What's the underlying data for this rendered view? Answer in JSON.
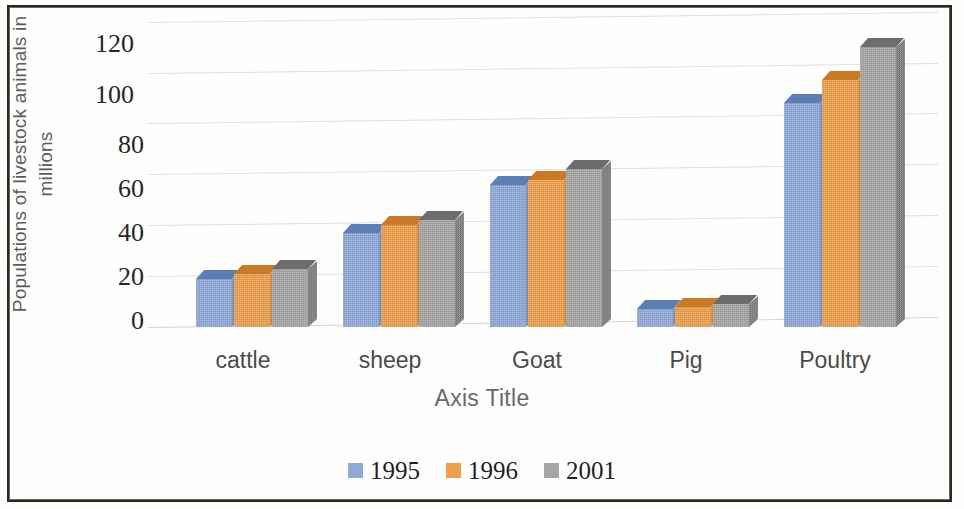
{
  "axes": {
    "y_title": "Populations of livestock animals in\nmillions",
    "x_title": "Axis Title",
    "y_ticks": [
      "0",
      "20",
      "40",
      "60",
      "80",
      "100",
      "120"
    ]
  },
  "legend": {
    "items": [
      {
        "label": "1995",
        "color": "#8faada"
      },
      {
        "label": "1996",
        "color": "#f0a04b"
      },
      {
        "label": "2001",
        "color": "#a6a6a6"
      }
    ]
  },
  "chart_data": {
    "type": "bar",
    "title": "",
    "subtitle": "",
    "xlabel": "Axis Title",
    "ylabel": "Populations of livestock animals in millions",
    "categories": [
      "cattle",
      "sheep",
      "Goat",
      "Pig",
      "Poultry"
    ],
    "series": [
      {
        "name": "1995",
        "color": "#8faada",
        "values": [
          19,
          37,
          56,
          7,
          88
        ]
      },
      {
        "name": "1996",
        "color": "#f0a04b",
        "values": [
          21,
          40,
          58,
          8,
          97
        ]
      },
      {
        "name": "2001",
        "color": "#a6a6a6",
        "values": [
          23,
          42,
          62,
          9,
          110
        ]
      }
    ],
    "ylim": [
      0,
      120
    ],
    "ytick_step": 20,
    "grid": true,
    "legend_position": "bottom",
    "three_d": true
  }
}
